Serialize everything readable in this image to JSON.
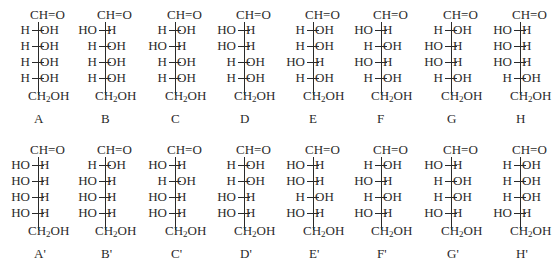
{
  "figure": {
    "top_group": "CH=O",
    "bottom_group_main": "CH",
    "bottom_group_sub": "2",
    "bottom_group_tail": "OH",
    "rows": [
      {
        "structures": [
          {
            "label": "A",
            "substituents": [
              [
                "H",
                "OH"
              ],
              [
                "H",
                "OH"
              ],
              [
                "H",
                "OH"
              ],
              [
                "H",
                "OH"
              ]
            ]
          },
          {
            "label": "B",
            "substituents": [
              [
                "HO",
                "H"
              ],
              [
                "H",
                "OH"
              ],
              [
                "H",
                "OH"
              ],
              [
                "H",
                "OH"
              ]
            ]
          },
          {
            "label": "C",
            "substituents": [
              [
                "H",
                "OH"
              ],
              [
                "HO",
                "H"
              ],
              [
                "H",
                "OH"
              ],
              [
                "H",
                "OH"
              ]
            ]
          },
          {
            "label": "D",
            "substituents": [
              [
                "HO",
                "H"
              ],
              [
                "HO",
                "H"
              ],
              [
                "H",
                "OH"
              ],
              [
                "H",
                "OH"
              ]
            ]
          },
          {
            "label": "E",
            "substituents": [
              [
                "H",
                "OH"
              ],
              [
                "H",
                "OH"
              ],
              [
                "HO",
                "H"
              ],
              [
                "H",
                "OH"
              ]
            ]
          },
          {
            "label": "F",
            "substituents": [
              [
                "HO",
                "H"
              ],
              [
                "H",
                "OH"
              ],
              [
                "HO",
                "H"
              ],
              [
                "H",
                "OH"
              ]
            ]
          },
          {
            "label": "G",
            "substituents": [
              [
                "H",
                "OH"
              ],
              [
                "HO",
                "H"
              ],
              [
                "HO",
                "H"
              ],
              [
                "H",
                "OH"
              ]
            ]
          },
          {
            "label": "H",
            "substituents": [
              [
                "HO",
                "H"
              ],
              [
                "HO",
                "H"
              ],
              [
                "HO",
                "H"
              ],
              [
                "H",
                "OH"
              ]
            ]
          }
        ]
      },
      {
        "structures": [
          {
            "label": "A'",
            "substituents": [
              [
                "HO",
                "H"
              ],
              [
                "HO",
                "H"
              ],
              [
                "HO",
                "H"
              ],
              [
                "HO",
                "H"
              ]
            ]
          },
          {
            "label": "B'",
            "substituents": [
              [
                "H",
                "OH"
              ],
              [
                "HO",
                "H"
              ],
              [
                "HO",
                "H"
              ],
              [
                "HO",
                "H"
              ]
            ]
          },
          {
            "label": "C'",
            "substituents": [
              [
                "HO",
                "H"
              ],
              [
                "H",
                "OH"
              ],
              [
                "HO",
                "H"
              ],
              [
                "HO",
                "H"
              ]
            ]
          },
          {
            "label": "D'",
            "substituents": [
              [
                "H",
                "OH"
              ],
              [
                "H",
                "OH"
              ],
              [
                "HO",
                "H"
              ],
              [
                "HO",
                "H"
              ]
            ]
          },
          {
            "label": "E'",
            "substituents": [
              [
                "HO",
                "H"
              ],
              [
                "HO",
                "H"
              ],
              [
                "H",
                "OH"
              ],
              [
                "HO",
                "H"
              ]
            ]
          },
          {
            "label": "F'",
            "substituents": [
              [
                "H",
                "OH"
              ],
              [
                "HO",
                "H"
              ],
              [
                "H",
                "OH"
              ],
              [
                "HO",
                "H"
              ]
            ]
          },
          {
            "label": "G'",
            "substituents": [
              [
                "HO",
                "H"
              ],
              [
                "H",
                "OH"
              ],
              [
                "H",
                "OH"
              ],
              [
                "HO",
                "H"
              ]
            ]
          },
          {
            "label": "H'",
            "substituents": [
              [
                "H",
                "OH"
              ],
              [
                "H",
                "OH"
              ],
              [
                "H",
                "OH"
              ],
              [
                "HO",
                "H"
              ]
            ]
          }
        ]
      }
    ]
  }
}
